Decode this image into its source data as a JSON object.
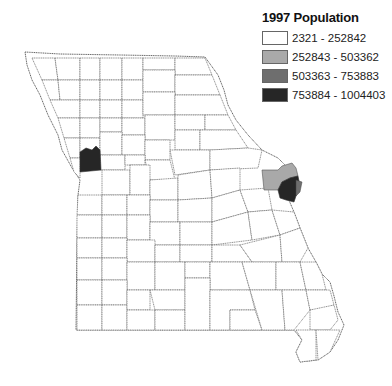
{
  "legend": {
    "title": "1997 Population",
    "classes": [
      {
        "label": "2321 - 252842",
        "color": "#ffffff"
      },
      {
        "label": "252843 - 503362",
        "color": "#a9a9a9"
      },
      {
        "label": "503363 - 753883",
        "color": "#6e6e6e"
      },
      {
        "label": "753884 - 1004403",
        "color": "#262626"
      }
    ]
  },
  "map": {
    "subject": "Missouri counties",
    "highlighted": [
      {
        "region": "west-central border (Jackson County area)",
        "class": "753884 - 1004403"
      },
      {
        "region": "east border north of river (St. Charles area)",
        "class": "252843 - 503362"
      },
      {
        "region": "east border (St. Louis County area)",
        "class": "753884 - 1004403"
      },
      {
        "region": "east border sliver (St. Louis City)",
        "class": "503363 - 753883"
      }
    ]
  }
}
